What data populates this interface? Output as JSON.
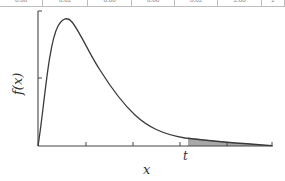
{
  "table_fragment": {
    "cells": [
      "0.00",
      "0.02",
      "0.00",
      "0.00",
      "0.02",
      "2.00",
      "2"
    ],
    "widths": [
      43,
      45,
      44,
      43,
      43,
      44,
      23
    ]
  },
  "chart_data": {
    "type": "line",
    "title": "",
    "xlabel": "x",
    "ylabel": "f(x)",
    "annotations": [
      "t"
    ],
    "shaded_region": {
      "from": "t",
      "to": "end",
      "description": "upper tail area shaded gray"
    },
    "x_ticks": 4,
    "y_ticks": 1,
    "tick_labels_shown": false,
    "grid": false,
    "legend": "none",
    "curve_shape": "right-skewed density (peak near x=0.12 of range, long right tail)",
    "x": [
      0,
      0.05,
      0.1,
      0.12,
      0.15,
      0.2,
      0.25,
      0.3,
      0.35,
      0.4,
      0.5,
      0.6,
      0.7,
      0.8,
      0.9,
      1.0
    ],
    "y": [
      0,
      0.72,
      0.97,
      1.0,
      0.97,
      0.85,
      0.7,
      0.55,
      0.42,
      0.32,
      0.18,
      0.1,
      0.06,
      0.035,
      0.018,
      0.005
    ]
  },
  "labels": {
    "xlabel": "x",
    "ylabel": "f(x)",
    "t": "t"
  },
  "colors": {
    "axis": "#444444",
    "curve": "#3a3a3a",
    "shade": "#a8a8a8"
  }
}
